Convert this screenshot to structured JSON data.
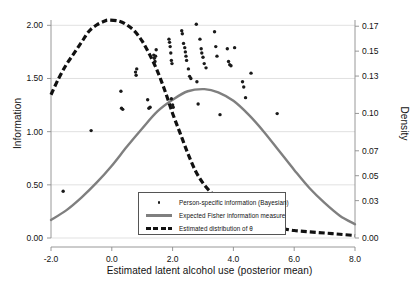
{
  "chart_data": {
    "type": "scatter",
    "title": "",
    "xlabel": "Estimated latent alcohol use (posterior mean)",
    "ylabel": "Information",
    "y2label": "Density",
    "xlim": [
      -2.0,
      8.0
    ],
    "ylim": [
      0.0,
      2.05
    ],
    "y2lim": [
      0.0,
      0.175
    ],
    "grid": true,
    "xticks": [
      "-2.0",
      "0.0",
      "2.0",
      "4.0",
      "6.0",
      "8.0"
    ],
    "xtick_values": [
      -2.0,
      0.0,
      2.0,
      4.0,
      6.0,
      8.0
    ],
    "yticks": [
      "0.00",
      "0.50",
      "1.00",
      "1.50",
      "2.00"
    ],
    "ytick_values": [
      0.0,
      0.5,
      1.0,
      1.5,
      2.0
    ],
    "y2ticks": [
      "0.00",
      "0.03",
      "0.05",
      "0.07",
      "0.10",
      "0.13",
      "0.15",
      "0.17"
    ],
    "y2tick_values": [
      0.0,
      0.03,
      0.05,
      0.07,
      0.1,
      0.13,
      0.15,
      0.17
    ],
    "legend_position": "lower-center",
    "series": [
      {
        "name": "Person-specific information (Bayesian)",
        "type": "scatter",
        "marker": "dot",
        "color": "#1a1a1a",
        "axis": "left",
        "points": [
          [
            -1.6,
            0.44
          ],
          [
            -0.68,
            1.01
          ],
          [
            0.3,
            1.38
          ],
          [
            0.32,
            1.22
          ],
          [
            0.36,
            1.21
          ],
          [
            0.78,
            1.56
          ],
          [
            0.8,
            1.53
          ],
          [
            0.82,
            1.59
          ],
          [
            1.18,
            1.3
          ],
          [
            1.22,
            1.22
          ],
          [
            1.26,
            1.23
          ],
          [
            1.38,
            1.72
          ],
          [
            1.4,
            1.69
          ],
          [
            1.42,
            1.66
          ],
          [
            1.44,
            1.71
          ],
          [
            1.46,
            1.77
          ],
          [
            1.88,
            1.87
          ],
          [
            1.9,
            1.84
          ],
          [
            1.92,
            1.8
          ],
          [
            1.94,
            1.74
          ],
          [
            1.96,
            1.67
          ],
          [
            1.98,
            1.64
          ],
          [
            1.96,
            1.31
          ],
          [
            2.0,
            1.25
          ],
          [
            2.02,
            1.23
          ],
          [
            2.3,
            1.95
          ],
          [
            2.32,
            1.92
          ],
          [
            2.36,
            1.83
          ],
          [
            2.4,
            1.79
          ],
          [
            2.42,
            1.75
          ],
          [
            2.44,
            1.71
          ],
          [
            2.46,
            1.67
          ],
          [
            2.52,
            1.59
          ],
          [
            2.56,
            1.52
          ],
          [
            2.6,
            1.5
          ],
          [
            2.78,
            2.01
          ],
          [
            2.8,
            1.47
          ],
          [
            2.84,
            1.26
          ],
          [
            2.9,
            1.87
          ],
          [
            2.94,
            1.78
          ],
          [
            2.96,
            1.74
          ],
          [
            3.0,
            1.7
          ],
          [
            3.04,
            1.64
          ],
          [
            3.1,
            1.6
          ],
          [
            3.38,
            1.94
          ],
          [
            3.42,
            1.8
          ],
          [
            3.46,
            1.71
          ],
          [
            3.56,
            1.16
          ],
          [
            3.8,
            1.78
          ],
          [
            3.84,
            1.66
          ],
          [
            3.88,
            1.63
          ],
          [
            3.92,
            1.62
          ],
          [
            4.04,
            1.79
          ],
          [
            4.3,
            1.47
          ],
          [
            4.34,
            1.42
          ],
          [
            4.4,
            1.32
          ],
          [
            4.58,
            1.55
          ],
          [
            5.44,
            1.17
          ]
        ]
      },
      {
        "name": "Expected Fisher information measure",
        "type": "line",
        "style": "solid",
        "color": "#7f7f7f",
        "axis": "left",
        "description": "Bell-shaped curve peaking near x=3.05 at y=1.40",
        "points": [
          [
            -2.0,
            0.17
          ],
          [
            -1.5,
            0.26
          ],
          [
            -1.0,
            0.38
          ],
          [
            -0.5,
            0.52
          ],
          [
            0.0,
            0.68
          ],
          [
            0.5,
            0.86
          ],
          [
            1.0,
            1.03
          ],
          [
            1.5,
            1.19
          ],
          [
            2.0,
            1.3
          ],
          [
            2.5,
            1.38
          ],
          [
            3.05,
            1.4
          ],
          [
            3.5,
            1.37
          ],
          [
            4.0,
            1.29
          ],
          [
            4.5,
            1.16
          ],
          [
            5.0,
            1.0
          ],
          [
            5.5,
            0.82
          ],
          [
            6.0,
            0.64
          ],
          [
            6.5,
            0.47
          ],
          [
            7.0,
            0.33
          ],
          [
            7.5,
            0.21
          ],
          [
            8.0,
            0.13
          ]
        ]
      },
      {
        "name": "Estimated distribution of θ",
        "type": "line",
        "style": "dashed",
        "color": "#111111",
        "axis": "right",
        "description": "Density curve peaking near x=-0.1 at density 0.175",
        "points": [
          [
            -2.0,
            0.115
          ],
          [
            -1.75,
            0.128
          ],
          [
            -1.5,
            0.139
          ],
          [
            -1.25,
            0.148
          ],
          [
            -1.0,
            0.157
          ],
          [
            -0.75,
            0.166
          ],
          [
            -0.5,
            0.171
          ],
          [
            -0.25,
            0.174
          ],
          [
            -0.1,
            0.175
          ],
          [
            0.25,
            0.174
          ],
          [
            0.5,
            0.171
          ],
          [
            0.75,
            0.166
          ],
          [
            1.0,
            0.158
          ],
          [
            1.25,
            0.147
          ],
          [
            1.5,
            0.134
          ],
          [
            1.75,
            0.118
          ],
          [
            2.0,
            0.1
          ],
          [
            2.25,
            0.084
          ],
          [
            2.5,
            0.068
          ],
          [
            2.75,
            0.054
          ],
          [
            3.0,
            0.044
          ],
          [
            3.25,
            0.037
          ],
          [
            3.5,
            0.032
          ],
          [
            3.75,
            0.03
          ],
          [
            4.0,
            0.029
          ],
          [
            4.3,
            0.012
          ],
          [
            4.6,
            0.011
          ],
          [
            5.0,
            0.01
          ],
          [
            5.5,
            0.008
          ],
          [
            6.0,
            0.006
          ],
          [
            6.5,
            0.005
          ],
          [
            7.0,
            0.004
          ],
          [
            7.5,
            0.003
          ],
          [
            8.0,
            0.002
          ]
        ]
      }
    ]
  },
  "legend": {
    "entries": [
      {
        "label": "Person-specific information (Bayesian)",
        "key": "dot"
      },
      {
        "label": "Expected Fisher information measure",
        "key": "solid-line"
      },
      {
        "label": "Estimated distribution of θ",
        "key": "dashed-line"
      }
    ]
  },
  "colors": {
    "scatter": "#1a1a1a",
    "fisher_line": "#7f7f7f",
    "density_line": "#111111",
    "grid": "#d9d9d9",
    "axis": "#8c8c8c",
    "text": "#111111"
  }
}
